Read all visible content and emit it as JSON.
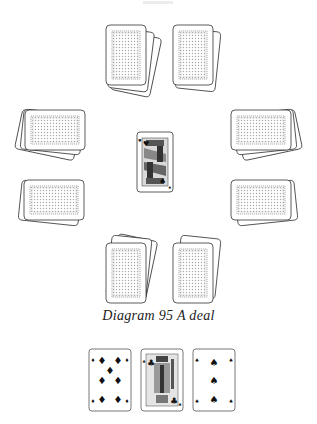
{
  "figure": {
    "caption": "Diagram 95  A deal",
    "background": "#ffffff",
    "line_color": "#333333",
    "back_pattern_color": "#9a9a9a"
  },
  "deal": {
    "hands": [
      {
        "position": "top-left",
        "orientation": "portrait",
        "cards_visible": 3,
        "face": "down"
      },
      {
        "position": "top-right",
        "orientation": "portrait",
        "cards_visible": 2,
        "face": "down"
      },
      {
        "position": "left-upper",
        "orientation": "landscape",
        "cards_visible": 3,
        "face": "down"
      },
      {
        "position": "left-lower",
        "orientation": "landscape",
        "cards_visible": 2,
        "face": "down"
      },
      {
        "position": "right-upper",
        "orientation": "landscape",
        "cards_visible": 3,
        "face": "down"
      },
      {
        "position": "right-lower",
        "orientation": "landscape",
        "cards_visible": 2,
        "face": "down"
      },
      {
        "position": "bottom-left",
        "orientation": "portrait",
        "cards_visible": 3,
        "face": "down"
      },
      {
        "position": "bottom-right",
        "orientation": "portrait",
        "cards_visible": 2,
        "face": "down"
      }
    ],
    "center_card": {
      "rank": "face card",
      "suit": "hearts",
      "suit_glyph": "♥",
      "face": "up"
    }
  },
  "bottom_row": {
    "cards": [
      {
        "rank": "7",
        "suit": "diamonds",
        "glyph": "♦"
      },
      {
        "rank": "J",
        "suit": "clubs",
        "glyph": "♣"
      },
      {
        "rank": "3",
        "suit": "spades",
        "glyph": "♠"
      }
    ]
  }
}
